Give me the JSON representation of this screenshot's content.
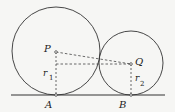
{
  "diagram": {
    "ground_line": {
      "x1": 11,
      "x2": 165,
      "y": 95
    },
    "circles": [
      {
        "name": "P",
        "cx": 56,
        "cy": 52,
        "r": 44
      },
      {
        "name": "Q",
        "cx": 131,
        "cy": 64,
        "r": 32
      }
    ],
    "labels": {
      "P": "P",
      "Q": "Q",
      "A": "A",
      "B": "B",
      "r1": "r",
      "r1_sub": "1",
      "r2": "r",
      "r2_sub": "2"
    },
    "colors": {
      "stroke": "#333333",
      "background": "#f6f6f4"
    }
  }
}
